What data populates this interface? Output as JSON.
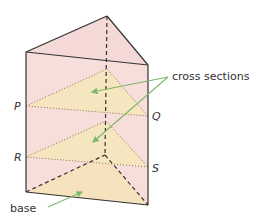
{
  "diagram": {
    "labels": {
      "cross_sections": "cross sections",
      "base": "base",
      "P": "P",
      "Q": "Q",
      "R": "R",
      "S": "S"
    },
    "colors": {
      "face_fill": "#f7dcd9",
      "section_fill": "#f6e6bf",
      "edge": "#333333",
      "arrow": "#7cb86a"
    }
  }
}
